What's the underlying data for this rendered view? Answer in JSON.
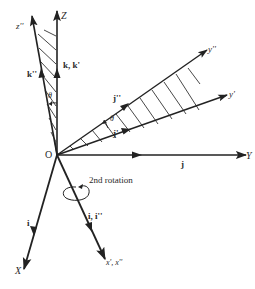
{
  "diagram": {
    "origin": {
      "label": "O",
      "x": 57,
      "y": 155
    },
    "axes": {
      "Z": {
        "label": "Z",
        "tip": [
          57,
          10
        ]
      },
      "z_dd": {
        "label": "z''",
        "tip": [
          32,
          15
        ]
      },
      "Y": {
        "label": "Y",
        "tip": [
          246,
          155
        ]
      },
      "y_dd": {
        "label": "y''",
        "tip": [
          208,
          49
        ]
      },
      "y_d": {
        "label": "y'",
        "tip": [
          228,
          95
        ]
      },
      "X": {
        "label": "X",
        "tip": [
          24,
          270
        ]
      },
      "x_d_dd": {
        "label": "x', x''",
        "tip": [
          106,
          260
        ]
      }
    },
    "unit_vectors": {
      "k_kd": "k, k'",
      "k_dd": "k''",
      "j": "j",
      "j_dd": "j''",
      "j_d": "j'",
      "i": "i",
      "i_idd": "i, i''"
    },
    "angles": {
      "theta_upper": "θ",
      "theta_right": "θ"
    },
    "annotation": "2nd rotation",
    "colors": {
      "line": "#222222",
      "text": "#2a2a2a",
      "background": "#ffffff"
    }
  }
}
